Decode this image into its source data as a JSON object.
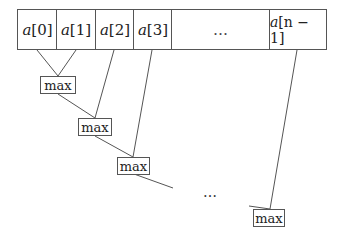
{
  "diagram": {
    "array_cells": [
      {
        "label": "a[0]",
        "var": "a",
        "index": "[0]"
      },
      {
        "label": "a[1]",
        "var": "a",
        "index": "[1]"
      },
      {
        "label": "a[2]",
        "var": "a",
        "index": "[2]"
      },
      {
        "label": "a[3]",
        "var": "a",
        "index": "[3]"
      },
      {
        "label": "…",
        "var": "",
        "index": "…"
      },
      {
        "label": "a[n − 1]",
        "var": "a",
        "index": "[n − 1]"
      }
    ],
    "max_nodes": [
      {
        "label": "max"
      },
      {
        "label": "max"
      },
      {
        "label": "max"
      },
      {
        "label": "max"
      }
    ],
    "ellipsis": "…",
    "colors": {
      "stroke": "#555555",
      "text": "#222222",
      "background": "#ffffff"
    }
  }
}
